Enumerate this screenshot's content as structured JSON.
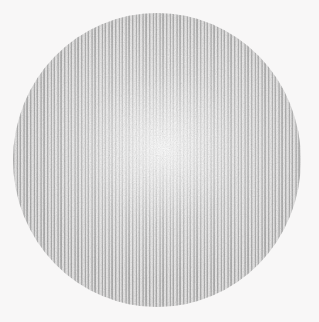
{
  "image": {
    "title": "Striped Circle",
    "width": 319,
    "height": 322,
    "background_color": "#f8f7f7",
    "description": "A large circle filled with fine vertical stripes on an off-white background"
  },
  "disc": {
    "name": "striped-circle",
    "center_x": 157,
    "center_y": 160,
    "left": 13,
    "top": 13,
    "width": 288,
    "height": 294,
    "shape": "ellipse"
  },
  "pattern": {
    "type": "vertical-stripes",
    "orientation": "vertical",
    "period_px": 3.4,
    "dark_width_px": 1.7,
    "light_width_px": 1.7,
    "dark_color": "#b2b2b2",
    "light_color": "#ecebeb",
    "stripe_count": 85,
    "edge_softness_px": 0.5
  },
  "texture": {
    "type": "paper-grain",
    "opacity": 0.3,
    "sheen_color": "#ffffff",
    "sheen_opacity": 0.28,
    "rim_shadow_color": "#c9c9c9"
  }
}
